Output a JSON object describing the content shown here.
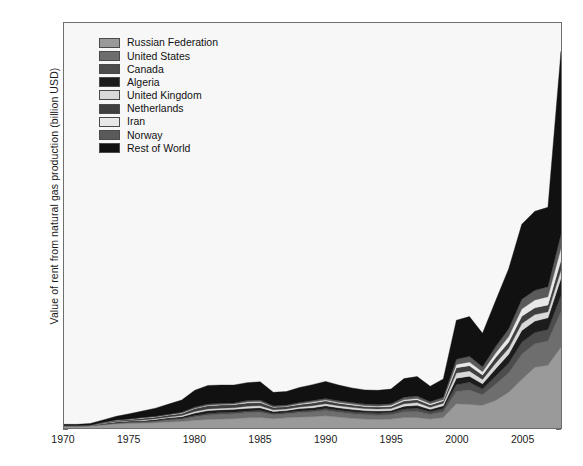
{
  "chart_data": {
    "type": "area",
    "stacked": true,
    "title": "",
    "xlabel": "",
    "ylabel": "Value of rent from natural gas production (billion USD)",
    "xlim": [
      1970,
      2008
    ],
    "ylim": [
      0,
      1000
    ],
    "xticks": [
      1970,
      1975,
      1980,
      1985,
      1990,
      1995,
      2000,
      2005
    ],
    "ytick_labels": [
      "0",
      "100",
      "200",
      "300",
      "400",
      "500",
      "600",
      "700",
      "800",
      "900",
      "1,000"
    ],
    "yticks": [
      0,
      100,
      200,
      300,
      400,
      500,
      600,
      700,
      800,
      900,
      1000
    ],
    "grid": false,
    "legend_position": "upper-left-inside",
    "x": [
      1970,
      1971,
      1972,
      1973,
      1974,
      1975,
      1976,
      1977,
      1978,
      1979,
      1980,
      1981,
      1982,
      1983,
      1984,
      1985,
      1986,
      1987,
      1988,
      1989,
      1990,
      1991,
      1992,
      1993,
      1994,
      1995,
      1996,
      1997,
      1998,
      1999,
      2000,
      2001,
      2002,
      2003,
      2004,
      2005,
      2006,
      2007,
      2008
    ],
    "series": [
      {
        "name": "Russian Federation",
        "color": "#9a9a9a",
        "values": [
          4,
          4,
          5,
          7,
          10,
          11,
          12,
          13,
          15,
          16,
          19,
          21,
          22,
          23,
          25,
          26,
          23,
          25,
          27,
          28,
          30,
          27,
          24,
          22,
          21,
          22,
          26,
          26,
          22,
          26,
          60,
          58,
          56,
          68,
          88,
          120,
          150,
          155,
          200
        ]
      },
      {
        "name": "United States",
        "color": "#6e6e6e",
        "values": [
          1,
          1,
          1,
          2,
          2,
          3,
          3,
          4,
          5,
          6,
          9,
          11,
          12,
          12,
          13,
          13,
          10,
          10,
          11,
          12,
          13,
          12,
          11,
          11,
          11,
          11,
          14,
          15,
          12,
          14,
          30,
          36,
          26,
          40,
          48,
          62,
          58,
          60,
          88
        ]
      },
      {
        "name": "Canada",
        "color": "#4d4d4d",
        "values": [
          0,
          0,
          0,
          1,
          1,
          1,
          1,
          1,
          2,
          2,
          3,
          4,
          4,
          4,
          4,
          4,
          3,
          3,
          4,
          4,
          5,
          5,
          5,
          5,
          5,
          5,
          7,
          8,
          6,
          8,
          17,
          19,
          14,
          20,
          24,
          30,
          28,
          28,
          40
        ]
      },
      {
        "name": "Algeria",
        "color": "#1c1c1c",
        "values": [
          0,
          0,
          0,
          1,
          2,
          2,
          2,
          3,
          3,
          4,
          6,
          7,
          7,
          7,
          7,
          7,
          5,
          5,
          6,
          6,
          7,
          6,
          6,
          5,
          5,
          5,
          7,
          7,
          6,
          7,
          16,
          15,
          13,
          18,
          22,
          29,
          28,
          29,
          42
        ]
      },
      {
        "name": "United Kingdom",
        "color": "#d9d9d9",
        "values": [
          0,
          0,
          0,
          1,
          1,
          1,
          2,
          2,
          2,
          3,
          4,
          4,
          4,
          4,
          5,
          5,
          4,
          4,
          4,
          5,
          5,
          5,
          5,
          5,
          5,
          5,
          6,
          7,
          5,
          6,
          13,
          13,
          11,
          14,
          15,
          17,
          16,
          15,
          20
        ]
      },
      {
        "name": "Netherlands",
        "color": "#3f3f3f",
        "values": [
          1,
          1,
          1,
          2,
          3,
          3,
          4,
          4,
          5,
          5,
          7,
          8,
          8,
          8,
          8,
          8,
          6,
          6,
          6,
          7,
          7,
          6,
          6,
          5,
          5,
          5,
          7,
          7,
          6,
          6,
          13,
          13,
          11,
          14,
          15,
          18,
          17,
          17,
          24
        ]
      },
      {
        "name": "Iran",
        "color": "#e8e8e8",
        "values": [
          0,
          0,
          0,
          0,
          1,
          1,
          1,
          1,
          1,
          1,
          1,
          1,
          1,
          1,
          2,
          2,
          1,
          1,
          2,
          2,
          2,
          2,
          2,
          2,
          2,
          3,
          3,
          3,
          3,
          3,
          8,
          9,
          8,
          11,
          14,
          18,
          19,
          20,
          30
        ]
      },
      {
        "name": "Norway",
        "color": "#5a5a5a",
        "values": [
          0,
          0,
          0,
          0,
          0,
          0,
          1,
          1,
          1,
          2,
          3,
          3,
          3,
          3,
          4,
          4,
          3,
          3,
          3,
          4,
          4,
          4,
          4,
          4,
          4,
          4,
          6,
          6,
          5,
          6,
          13,
          14,
          12,
          16,
          19,
          24,
          24,
          25,
          35
        ]
      },
      {
        "name": "Rest of World",
        "color": "#111111",
        "values": [
          3,
          3,
          4,
          6,
          9,
          13,
          16,
          20,
          25,
          30,
          41,
          46,
          45,
          44,
          44,
          45,
          33,
          33,
          37,
          39,
          42,
          39,
          36,
          35,
          35,
          36,
          46,
          48,
          38,
          45,
          96,
          98,
          83,
          113,
          148,
          185,
          195,
          196,
          451
        ]
      }
    ]
  },
  "legend": {
    "items": [
      {
        "label": "Russian Federation"
      },
      {
        "label": "United States"
      },
      {
        "label": "Canada"
      },
      {
        "label": "Algeria"
      },
      {
        "label": "United Kingdom"
      },
      {
        "label": "Netherlands"
      },
      {
        "label": "Iran"
      },
      {
        "label": "Norway"
      },
      {
        "label": "Rest of World"
      }
    ]
  }
}
